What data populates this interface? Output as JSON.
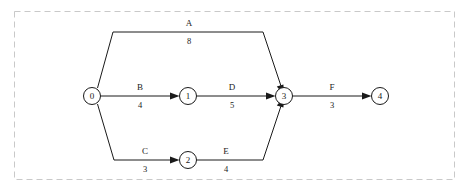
{
  "diagram": {
    "type": "activity-on-arrow-network",
    "colors": {
      "background": "#ffffff",
      "stroke": "#1a1a1a",
      "frame": "#c9c9c9"
    },
    "frame": {
      "style": "dashed",
      "x": 14,
      "y": 11,
      "width": 441,
      "height": 169
    },
    "nodes": [
      {
        "id": "n0",
        "label": "0",
        "cx": 92,
        "cy": 96,
        "r": 8.5
      },
      {
        "id": "n1",
        "label": "1",
        "cx": 188,
        "cy": 96,
        "r": 8.5
      },
      {
        "id": "n2",
        "label": "2",
        "cx": 188,
        "cy": 160,
        "r": 8.5
      },
      {
        "id": "n3",
        "label": "3",
        "cx": 284,
        "cy": 96,
        "r": 8.5
      },
      {
        "id": "n4",
        "label": "4",
        "cx": 380,
        "cy": 96,
        "r": 8.5
      }
    ],
    "edges": [
      {
        "id": "edge-a",
        "name": "A",
        "duration": "8",
        "from": "0",
        "to": "3",
        "name_x": 189,
        "name_y": 26,
        "dur_x": 189,
        "dur_y": 44
      },
      {
        "id": "edge-b",
        "name": "B",
        "duration": "4",
        "from": "0",
        "to": "1",
        "name_x": 140,
        "name_y": 90,
        "dur_x": 140,
        "dur_y": 108
      },
      {
        "id": "edge-c",
        "name": "C",
        "duration": "3",
        "from": "0",
        "to": "2",
        "name_x": 145,
        "name_y": 154,
        "dur_x": 145,
        "dur_y": 172
      },
      {
        "id": "edge-d",
        "name": "D",
        "duration": "5",
        "from": "1",
        "to": "3",
        "name_x": 232,
        "name_y": 90,
        "dur_x": 232,
        "dur_y": 108
      },
      {
        "id": "edge-e",
        "name": "E",
        "duration": "4",
        "from": "2",
        "to": "3",
        "name_x": 226,
        "name_y": 154,
        "dur_x": 226,
        "dur_y": 172
      },
      {
        "id": "edge-f",
        "name": "F",
        "duration": "3",
        "from": "3",
        "to": "4",
        "name_x": 332,
        "name_y": 90,
        "dur_x": 332,
        "dur_y": 108
      }
    ]
  }
}
